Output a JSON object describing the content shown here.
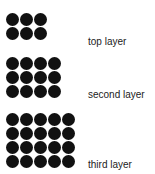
{
  "diagram": {
    "layers": [
      {
        "label": "top layer",
        "columns": 3,
        "rows": 2,
        "count": 6
      },
      {
        "label": "second layer",
        "columns": 4,
        "rows": 3,
        "count": 12
      },
      {
        "label": "third layer",
        "columns": 5,
        "rows": 4,
        "count": 20
      }
    ],
    "dot_color": "#111111"
  }
}
